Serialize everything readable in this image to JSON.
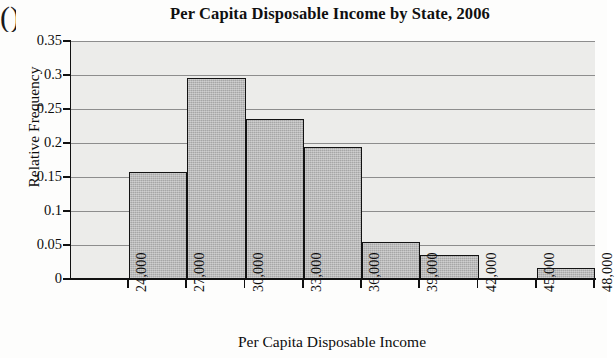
{
  "page": {
    "artifact_glyph": "()"
  },
  "chart_data": {
    "type": "bar",
    "title": "Per Capita Disposable Income by State, 2006",
    "xlabel": "Per Capita Disposable Income",
    "ylabel": "Relative Frequency",
    "grid": true,
    "legend": "none",
    "xlim": [
      24000,
      48000
    ],
    "ylim": [
      0,
      0.35
    ],
    "bin_width": 3000,
    "x_tick_labels": [
      "24,000",
      "27,000",
      "30,000",
      "33,000",
      "36,000",
      "39,000",
      "42,000",
      "45,000",
      "48,000"
    ],
    "x_tick_values": [
      24000,
      27000,
      30000,
      33000,
      36000,
      39000,
      42000,
      45000,
      48000
    ],
    "y_tick_labels": [
      "0",
      "0.05",
      "0.1",
      "0.15",
      "0.2",
      "0.25",
      "0.3",
      "0.35"
    ],
    "y_tick_values": [
      0,
      0.05,
      0.1,
      0.15,
      0.2,
      0.25,
      0.3,
      0.35
    ],
    "categories": [
      "24,000-27,000",
      "27,000-30,000",
      "30,000-33,000",
      "33,000-36,000",
      "36,000-39,000",
      "39,000-42,000",
      "42,000-45,000",
      "45,000-48,000"
    ],
    "bins": [
      {
        "start": 24000,
        "end": 27000,
        "value": 0.157
      },
      {
        "start": 27000,
        "end": 30000,
        "value": 0.295
      },
      {
        "start": 30000,
        "end": 33000,
        "value": 0.235
      },
      {
        "start": 33000,
        "end": 36000,
        "value": 0.194
      },
      {
        "start": 36000,
        "end": 39000,
        "value": 0.055
      },
      {
        "start": 39000,
        "end": 42000,
        "value": 0.035
      },
      {
        "start": 42000,
        "end": 45000,
        "value": 0.0
      },
      {
        "start": 45000,
        "end": 48000,
        "value": 0.016
      }
    ],
    "values": [
      0.157,
      0.295,
      0.235,
      0.194,
      0.055,
      0.035,
      0.0,
      0.016
    ],
    "bar_fill_color": "#a6a6a6",
    "bar_edge_color": "#131313",
    "plot_background_color": "#ececea",
    "gridline_color": "#8d8d8d"
  }
}
